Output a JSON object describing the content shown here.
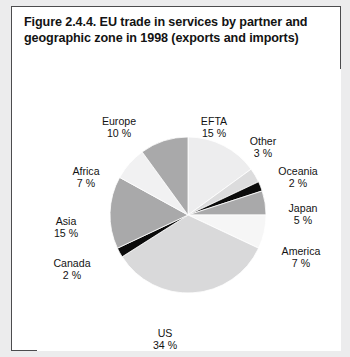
{
  "figure": {
    "title": "Figure 2.4.4. EU trade in services by partner and geographic zone in 1998 (exports and imports)",
    "border_color": "#4c4c4e",
    "background_color": "#ececed",
    "panel_color": "#ffffff"
  },
  "chart_data": {
    "type": "pie",
    "title": "Figure 2.4.4. EU trade in services by partner and geographic zone in 1998 (exports and imports)",
    "unit": "%",
    "value_suffix": " %",
    "legend": "none",
    "start_angle_deg": -90,
    "direction": "clockwise",
    "categories": [
      "EFTA",
      "Other",
      "Oceania",
      "Japan",
      "America",
      "US",
      "Canada",
      "Asia",
      "Africa",
      "Europe"
    ],
    "values": [
      15,
      3,
      2,
      5,
      7,
      34,
      2,
      15,
      7,
      10
    ],
    "total": 100,
    "slices": [
      {
        "name": "EFTA",
        "value": 15,
        "label": "EFTA",
        "value_label": "15 %",
        "color": "#ededee",
        "label_x": 152,
        "label_y": 46,
        "label_w": 50
      },
      {
        "name": "Other",
        "value": 3,
        "label": "Other",
        "value_label": "3 %",
        "color": "#dcdcdd",
        "label_x": 202,
        "label_y": 66,
        "label_w": 48
      },
      {
        "name": "Oceania",
        "value": 2,
        "label": "Oceania",
        "value_label": "2 %",
        "color": "#0b0b0b",
        "label_x": 230,
        "label_y": 96,
        "label_w": 62
      },
      {
        "name": "Japan",
        "value": 5,
        "label": "Japan",
        "value_label": "5 %",
        "color": "#a9a9aa",
        "label_x": 240,
        "label_y": 133,
        "label_w": 52
      },
      {
        "name": "America",
        "value": 7,
        "label": "America",
        "value_label": "7 %",
        "color": "#f6f6f6",
        "label_x": 232,
        "label_y": 176,
        "label_w": 64
      },
      {
        "name": "US",
        "value": 34,
        "label": "US",
        "value_label": "34 %",
        "color": "#d9d9da",
        "label_x": 104,
        "label_y": 258,
        "label_w": 48
      },
      {
        "name": "Canada",
        "value": 2,
        "label": "Canada",
        "value_label": "2 %",
        "color": "#0b0b0b",
        "label_x": 6,
        "label_y": 188,
        "label_w": 58
      },
      {
        "name": "Asia",
        "value": 15,
        "label": "Asia",
        "value_label": "15 %",
        "color": "#a9a9aa",
        "label_x": 6,
        "label_y": 146,
        "label_w": 46
      },
      {
        "name": "Africa",
        "value": 7,
        "label": "Africa",
        "value_label": "7 %",
        "color": "#f1f1f2",
        "label_x": 22,
        "label_y": 96,
        "label_w": 54
      },
      {
        "name": "Europe",
        "value": 10,
        "label": "Europe",
        "value_label": "10 %",
        "color": "#a9a9aa",
        "label_x": 52,
        "label_y": 46,
        "label_w": 60
      }
    ],
    "geometry": {
      "center_x": 151,
      "center_y": 146,
      "radius": 78
    }
  }
}
